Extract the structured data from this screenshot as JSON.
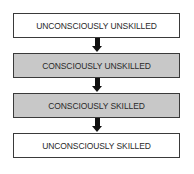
{
  "diagram": {
    "type": "flowchart",
    "direction": "top-to-bottom",
    "stages": [
      {
        "label": "UNCONSCIOUSLY UNSKILLED",
        "fill": "#ffffff"
      },
      {
        "label": "CONSCIOUSLY UNSKILLED",
        "fill": "#c8c8c8"
      },
      {
        "label": "CONSCIOUSLY SKILLED",
        "fill": "#c8c8c8"
      },
      {
        "label": "UNCONSCIOUSLY SKILLED",
        "fill": "#ffffff"
      }
    ],
    "arrow_color": "#111111"
  }
}
